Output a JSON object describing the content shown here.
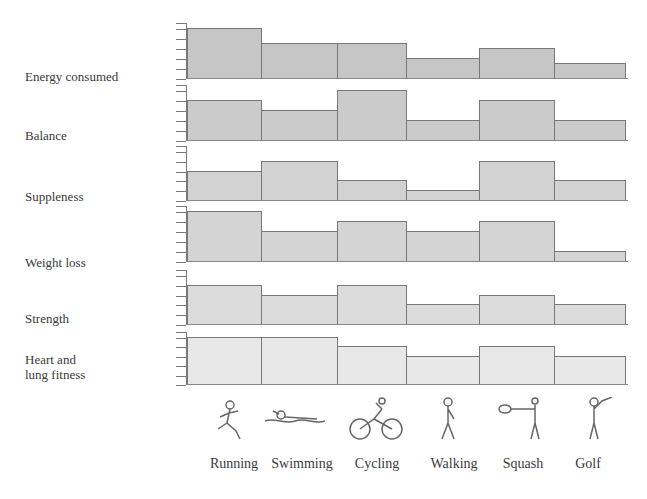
{
  "chart_data": {
    "type": "bar",
    "title": "",
    "xlabel": "",
    "ylabel": "",
    "ylim": [
      0,
      5
    ],
    "grid": false,
    "categories": [
      "Running",
      "Swimming",
      "Cycling",
      "Walking",
      "Squash",
      "Golf"
    ],
    "series": [
      {
        "name": "Energy consumed",
        "values": [
          5,
          3.5,
          3.5,
          2,
          3,
          1.5
        ]
      },
      {
        "name": "Balance",
        "values": [
          4,
          3,
          5,
          2,
          4,
          2
        ]
      },
      {
        "name": "Suppleness",
        "values": [
          3,
          4,
          2,
          1,
          4,
          2
        ]
      },
      {
        "name": "Weight loss",
        "values": [
          5,
          3,
          4,
          3,
          4,
          1
        ]
      },
      {
        "name": "Strength",
        "values": [
          4,
          3,
          4,
          2,
          3,
          2
        ]
      },
      {
        "name": "Heart and lung fitness",
        "values": [
          5,
          5,
          4,
          3,
          4,
          3
        ]
      }
    ]
  },
  "row_labels": [
    "Energy consumed",
    "Balance",
    "Suppleness",
    "Weight loss",
    "Strength",
    "Heart and lung\nfitness"
  ],
  "row_label_lines": [
    [
      "Energy consumed"
    ],
    [
      "Balance"
    ],
    [
      "Suppleness"
    ],
    [
      "Weight loss"
    ],
    [
      "Strength"
    ],
    [
      "Heart and",
      "lung fitness"
    ]
  ],
  "panel_colors": [
    "#c6c6c6",
    "#cbcbcb",
    "#d2d2d2",
    "#d4d4d4",
    "#dcdcdc",
    "#e8e8e8"
  ],
  "icons": [
    "running-figure-icon",
    "swimming-figure-icon",
    "cycling-figure-icon",
    "walking-figure-icon",
    "squash-figure-icon",
    "golf-figure-icon"
  ]
}
